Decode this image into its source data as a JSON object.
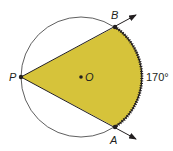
{
  "diagram": {
    "colors": {
      "fill": "#d6c33a",
      "stroke": "#231f20",
      "circle": "#4d4d4d",
      "background": "#ffffff"
    },
    "circle": {
      "center_label": "O",
      "cx": 81,
      "cy": 77,
      "r": 60
    },
    "points": {
      "P": {
        "label": "P",
        "x": 21,
        "y": 77
      },
      "B": {
        "label": "B",
        "x": 115,
        "y": 27
      },
      "A": {
        "label": "A",
        "x": 115,
        "y": 127
      },
      "O": {
        "label": "O",
        "x": 81,
        "y": 77
      }
    },
    "arc_measure_label": "170°",
    "rays": [
      {
        "from": "P",
        "through": "B",
        "arrow": true
      },
      {
        "from": "P",
        "through": "A",
        "arrow": true
      }
    ]
  }
}
